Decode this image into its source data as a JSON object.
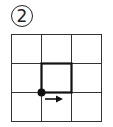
{
  "label": "2",
  "grid": {
    "rows": 3,
    "cols": 3,
    "x0": 11,
    "y0": 34,
    "cell_w": 30,
    "cell_h": 29,
    "color": "#333333"
  },
  "highlight_square": {
    "col": 1,
    "row": 1,
    "color": "#111111"
  },
  "dot": {
    "x": 41,
    "y": 92,
    "color": "#111111"
  },
  "arrow": {
    "direction": "right",
    "x1": 45,
    "x2": 62,
    "y": 99,
    "color": "#111111"
  }
}
